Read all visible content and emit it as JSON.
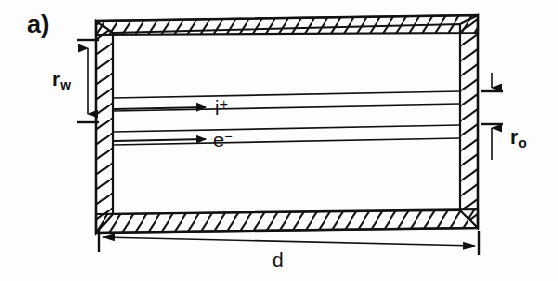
{
  "figure": {
    "panel_label": "a)",
    "colors": {
      "ink": "#111111",
      "background": "#fdfdfd",
      "hatch": "#111111"
    },
    "labels": {
      "wall_radius": "r",
      "wall_radius_sub": "w",
      "beam_radius": "r",
      "beam_radius_sub": "o",
      "length": "d",
      "ion_beam": "i",
      "ion_beam_sup": "+",
      "electron_beam": "e",
      "electron_beam_sup": "−"
    },
    "dimensions": [
      {
        "name": "r_w",
        "text": "r",
        "subscript": "w",
        "orientation": "vertical",
        "side": "left",
        "meaning": "wall radius"
      },
      {
        "name": "r_o",
        "text": "r",
        "subscript": "o",
        "orientation": "vertical",
        "side": "right",
        "meaning": "beam radius"
      },
      {
        "name": "d",
        "text": "d",
        "subscript": "",
        "orientation": "horizontal",
        "side": "bottom",
        "meaning": "drift tube length"
      }
    ],
    "beams": [
      {
        "name": "ion-beam",
        "label": "i",
        "charge": "+",
        "direction": "right"
      },
      {
        "name": "electron-beam",
        "label": "e",
        "charge": "−",
        "direction": "right"
      }
    ]
  }
}
